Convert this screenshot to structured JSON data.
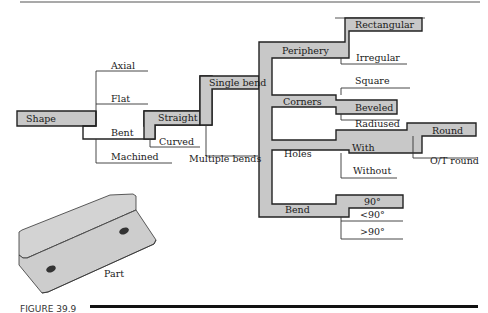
{
  "figure": {
    "caption": "FIGURE 39.9",
    "part_label": "Part"
  },
  "tree": {
    "root": "Shape",
    "shape_children": [
      "Axial",
      "Flat",
      "Bent",
      "Machined"
    ],
    "bent_children": [
      "Straight",
      "Curved"
    ],
    "straight_children": [
      "Single bend",
      "Multiple bends"
    ],
    "single_bend_children": [
      "Periphery",
      "Corners",
      "Holes",
      "Bend"
    ],
    "periphery_children": [
      "Rectangular",
      "Irregular"
    ],
    "corners_children": [
      "Square",
      "Beveled",
      "Radiused"
    ],
    "holes_children": [
      "With",
      "Without"
    ],
    "with_children": [
      "Round",
      "O/T round"
    ],
    "bend_children": [
      "90°",
      "<90°",
      ">90°"
    ],
    "highlighted_path": [
      "Shape",
      "Bent",
      "Straight",
      "Single bend",
      "Periphery",
      "Rectangular",
      "Corners",
      "Beveled",
      "Holes",
      "With",
      "Round",
      "Bend",
      "90°"
    ]
  },
  "colors": {
    "highlight_fill": "#c8c8c8",
    "outline": "#222222",
    "part_fill": "#d0d0d0"
  }
}
